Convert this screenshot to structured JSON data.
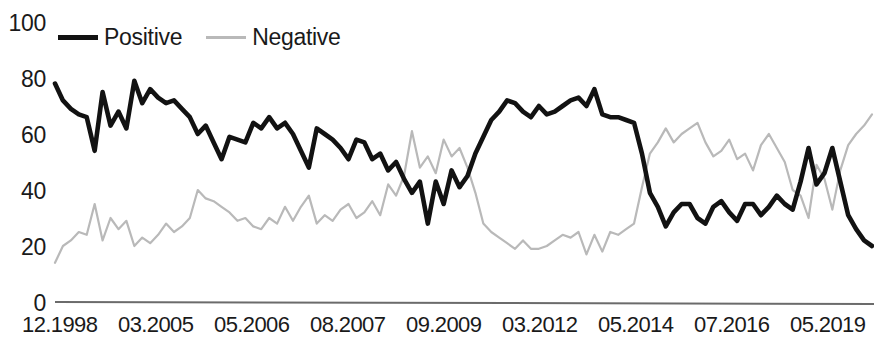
{
  "chart_data": {
    "type": "line",
    "title": "",
    "subtitle": "",
    "xlabel": "",
    "ylabel": "",
    "ylim": [
      0,
      100
    ],
    "yticks": [
      0,
      20,
      40,
      60,
      80,
      100
    ],
    "grid": false,
    "legend_position": "top-left",
    "xtick_labels": [
      "12.1998",
      "03.2005",
      "05.2006",
      "08.2007",
      "09.2009",
      "03.2012",
      "05.2014",
      "07.2016",
      "05.2019"
    ],
    "xtick_positions": [
      0,
      0.118,
      0.236,
      0.354,
      0.472,
      0.59,
      0.708,
      0.826,
      0.944
    ],
    "series": [
      {
        "name": "Positive",
        "color": "#121212",
        "values": [
          78,
          72,
          69,
          67,
          66,
          54,
          75,
          63,
          68,
          62,
          79,
          71,
          76,
          73,
          71,
          72,
          69,
          66,
          60,
          63,
          57,
          51,
          59,
          58,
          57,
          64,
          62,
          66,
          62,
          64,
          60,
          54,
          48,
          62,
          60,
          58,
          55,
          51,
          58,
          57,
          51,
          53,
          47,
          50,
          44,
          39,
          43,
          28,
          43,
          35,
          47,
          41,
          45,
          53,
          59,
          65,
          68,
          72,
          71,
          68,
          66,
          70,
          67,
          68,
          70,
          72,
          73,
          70,
          76,
          67,
          66,
          66,
          65,
          64,
          53,
          39,
          34,
          27,
          32,
          35,
          35,
          30,
          28,
          34,
          36,
          32,
          29,
          35,
          35,
          31,
          34,
          38,
          35,
          33,
          43,
          55,
          42,
          46,
          55,
          43,
          31,
          26,
          22,
          20
        ]
      },
      {
        "name": "Negative",
        "color": "#b9b9b9",
        "values": [
          14,
          20,
          22,
          25,
          24,
          35,
          22,
          30,
          26,
          29,
          20,
          23,
          21,
          24,
          28,
          25,
          27,
          30,
          40,
          37,
          36,
          34,
          32,
          29,
          30,
          27,
          26,
          30,
          28,
          34,
          29,
          34,
          38,
          28,
          31,
          29,
          33,
          35,
          30,
          32,
          36,
          31,
          42,
          38,
          45,
          61,
          48,
          52,
          46,
          58,
          52,
          55,
          48,
          39,
          28,
          25,
          23,
          21,
          19,
          22,
          19,
          19,
          20,
          22,
          24,
          23,
          25,
          17,
          24,
          18,
          25,
          24,
          26,
          28,
          41,
          53,
          57,
          62,
          57,
          60,
          62,
          64,
          57,
          52,
          54,
          58,
          51,
          53,
          47,
          56,
          60,
          55,
          50,
          40,
          38,
          30,
          49,
          44,
          33,
          47,
          56,
          60,
          63,
          67
        ]
      }
    ]
  },
  "legend": {
    "items": [
      {
        "label": "Positive",
        "style": "solid-black"
      },
      {
        "label": "Negative",
        "style": "solid-gray"
      }
    ]
  },
  "axes": {
    "y_labels": [
      "100",
      "80",
      "60",
      "40",
      "20",
      "0"
    ],
    "x_labels": [
      "12.1998",
      "03.2005",
      "05.2006",
      "08.2007",
      "09.2009",
      "03.2012",
      "05.2014",
      "07.2016",
      "05.2019"
    ]
  },
  "colors": {
    "positive": "#121212",
    "negative": "#b9b9b9",
    "axis": "#6b6b6b",
    "text": "#1a1a1a"
  }
}
